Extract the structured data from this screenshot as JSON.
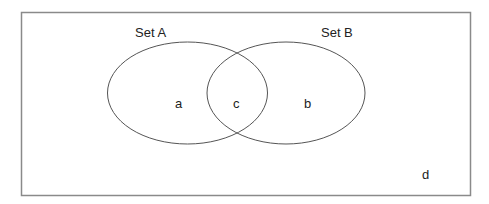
{
  "diagram": {
    "type": "venn",
    "universe": {
      "label": "d"
    },
    "sets": [
      {
        "name": "Set A",
        "region_label": "a"
      },
      {
        "name": "Set B",
        "region_label": "b"
      }
    ],
    "intersection": {
      "label": "c"
    },
    "colors": {
      "background": "#ffffff",
      "border": "#8a8a8a",
      "ellipse_stroke": "#555555",
      "text": "#222222"
    }
  }
}
